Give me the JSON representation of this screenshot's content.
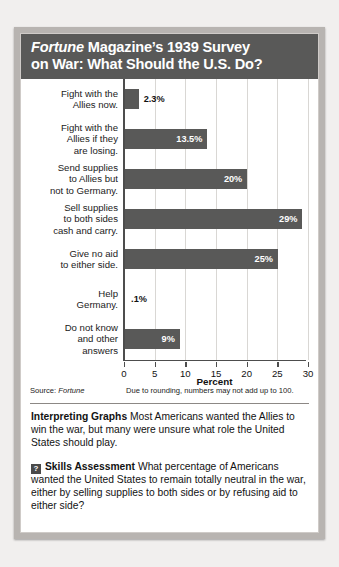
{
  "figure": {
    "title_line1_em": "Fortune",
    "title_line1_rest": " Magazine’s 1939 Survey",
    "title_line2": "on War: What Should the U.S. Do?",
    "source_label": "Source: ",
    "source_name": "Fortune",
    "source_note": "Due to rounding, numbers may not add up to 100."
  },
  "chart_data": {
    "type": "bar",
    "orientation": "horizontal",
    "title": "Fortune Magazine’s 1939 Survey on War: What Should the U.S. Do?",
    "xlabel": "Percent",
    "ylabel": "",
    "xlim": [
      0,
      30
    ],
    "xticks": [
      0,
      5,
      10,
      15,
      20,
      25,
      30
    ],
    "xtick_labels": [
      "0",
      "5",
      "10",
      "15",
      "20",
      "25",
      "30"
    ],
    "grid": true,
    "legend": "none",
    "bar_color": "#595958",
    "categories": [
      "Fight with the Allies now.",
      "Fight with the Allies if they are losing.",
      "Send supplies to Allies but not to Germany.",
      "Sell supplies to both sides cash and carry.",
      "Give no aid to either side.",
      "Help Germany.",
      "Do not know and other answers"
    ],
    "values": [
      2.3,
      13.5,
      20,
      29,
      25,
      0.1,
      9
    ],
    "value_labels": [
      "2.3%",
      "13.5%",
      "20%",
      "29%",
      "25%",
      ".1%",
      "9%"
    ],
    "label_placement": [
      "outside",
      "inside",
      "inside",
      "inside",
      "inside",
      "outside",
      "inside"
    ]
  },
  "categories_display": [
    {
      "lines": [
        "Fight with the",
        "Allies now."
      ]
    },
    {
      "lines": [
        "Fight with the",
        "Allies if they",
        "are losing."
      ]
    },
    {
      "lines": [
        "Send supplies",
        "to Allies but",
        "not to Germany."
      ]
    },
    {
      "lines": [
        "Sell supplies",
        "to both sides",
        "cash and carry."
      ]
    },
    {
      "lines": [
        "Give no aid",
        "to either side."
      ]
    },
    {
      "lines": [
        "Help",
        "Germany."
      ]
    },
    {
      "lines": [
        "Do not know",
        "and other",
        "answers"
      ]
    }
  ],
  "interpreting": {
    "heading": "Interpreting Graphs",
    "body": "  Most Americans wanted the Allies to win the war, but many were unsure what role the United States should play."
  },
  "skills": {
    "icon_glyph": "?",
    "heading": "Skills Assessment",
    "body": "  What percentage of Americans wanted the United States to remain totally neutral in the war, either by selling supplies to both sides or by refusing aid to either side?"
  }
}
